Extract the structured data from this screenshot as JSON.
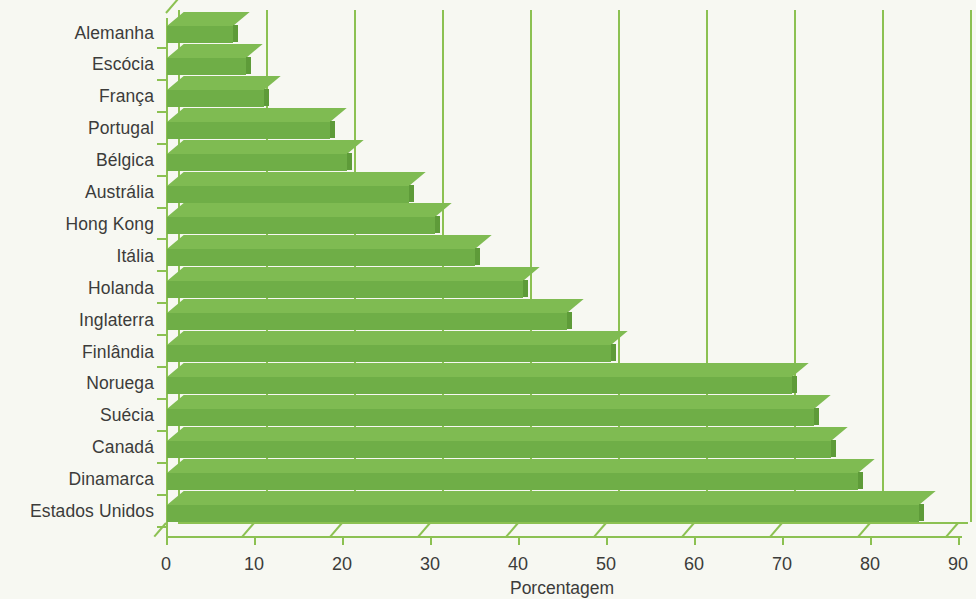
{
  "colors": {
    "background": "#f7f8f2",
    "bar_fill": "#6fae47",
    "bar_top": "#7fbb52",
    "bar_cap": "#5e9b39",
    "grid": "#8cc152",
    "text": "#3c3c3a"
  },
  "chart_data": {
    "type": "bar",
    "orientation": "horizontal",
    "title": "",
    "subtitle": "",
    "xlabel": "Porcentagem",
    "ylabel": "",
    "xlim": [
      0,
      90
    ],
    "xticks": [
      0,
      10,
      20,
      30,
      40,
      50,
      60,
      70,
      80,
      90
    ],
    "xtick_labels": [
      "0",
      "10",
      "20",
      "30",
      "40",
      "50",
      "60",
      "70",
      "80",
      "90"
    ],
    "grid": true,
    "grid_axis": "x",
    "legend": null,
    "legend_position": "none",
    "categories": [
      "Alemanha",
      "Escócia",
      "França",
      "Portugal",
      "Bélgica",
      "Austrália",
      "Hong Kong",
      "Itália",
      "Holanda",
      "Inglaterra",
      "Finlândia",
      "Noruega",
      "Suécia",
      "Canadá",
      "Dinamarca",
      "Estados Unidos"
    ],
    "values": [
      7.5,
      9,
      11,
      18.5,
      20.5,
      27.5,
      30.5,
      35,
      40.5,
      45.5,
      50.5,
      71,
      73.5,
      75.5,
      78.5,
      85.5
    ]
  }
}
